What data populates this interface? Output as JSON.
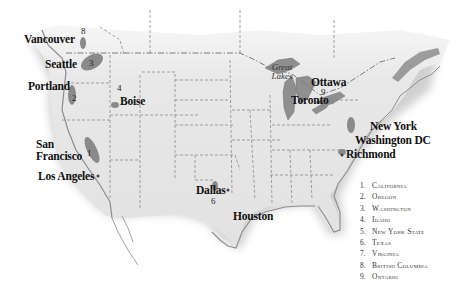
{
  "map": {
    "title": "",
    "colors": {
      "land": "#e6e6e6",
      "region_highlight": "#8c8c8c",
      "water": "#8f8f8f",
      "border": "#777777",
      "text": "#111111"
    },
    "cities": [
      {
        "name": "Vancouver",
        "x": 24,
        "y": 33
      },
      {
        "name": "Seattle",
        "x": 45,
        "y": 58
      },
      {
        "name": "Portland",
        "x": 28,
        "y": 80
      },
      {
        "name": "Boise",
        "x": 120,
        "y": 95
      },
      {
        "name": "San Francisco",
        "x": 36,
        "y": 139
      },
      {
        "name": "Los Angeles",
        "x": 38,
        "y": 170
      },
      {
        "name": "Dallas",
        "x": 196,
        "y": 187
      },
      {
        "name": "Houston",
        "x": 233,
        "y": 211
      },
      {
        "name": "Ottawa",
        "x": 311,
        "y": 78
      },
      {
        "name": "Toronto",
        "x": 291,
        "y": 94
      },
      {
        "name": "New York",
        "x": 370,
        "y": 120
      },
      {
        "name": "Washington DC",
        "x": 355,
        "y": 135
      },
      {
        "name": "Richmond",
        "x": 346,
        "y": 149
      }
    ],
    "region_numbers": [
      {
        "n": "1",
        "x": 86,
        "y": 152
      },
      {
        "n": "2",
        "x": 73,
        "y": 95
      },
      {
        "n": "3",
        "x": 91,
        "y": 60
      },
      {
        "n": "4",
        "x": 118,
        "y": 85
      },
      {
        "n": "5",
        "x": 351,
        "y": 131
      },
      {
        "n": "6",
        "x": 212,
        "y": 200
      },
      {
        "n": "7",
        "x": 341,
        "y": 148
      },
      {
        "n": "8",
        "x": 82,
        "y": 27
      },
      {
        "n": "9",
        "x": 322,
        "y": 89
      }
    ],
    "lakes_label": "Great Lakes"
  },
  "legend": {
    "items": [
      {
        "num": "1.",
        "name": "California"
      },
      {
        "num": "2.",
        "name": "Oregon"
      },
      {
        "num": "3.",
        "name": "Washington"
      },
      {
        "num": "4.",
        "name": "Idaho"
      },
      {
        "num": "5.",
        "name": "New York State"
      },
      {
        "num": "6.",
        "name": "Texas"
      },
      {
        "num": "7.",
        "name": "Virginia"
      },
      {
        "num": "8.",
        "name": "British Columbia"
      },
      {
        "num": "9.",
        "name": "Ontario"
      }
    ]
  }
}
